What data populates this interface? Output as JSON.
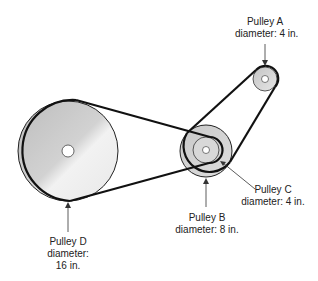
{
  "pulleys": {
    "A": {
      "name": "Pulley A",
      "diameter": "diameter: 4 in."
    },
    "B": {
      "name": "Pulley B",
      "diameter": "diameter: 8 in."
    },
    "C": {
      "name": "Pulley C",
      "diameter": "diameter: 4 in."
    },
    "D": {
      "name": "Pulley D",
      "diameter_label": "diameter:",
      "diameter_value": "16 in."
    }
  }
}
